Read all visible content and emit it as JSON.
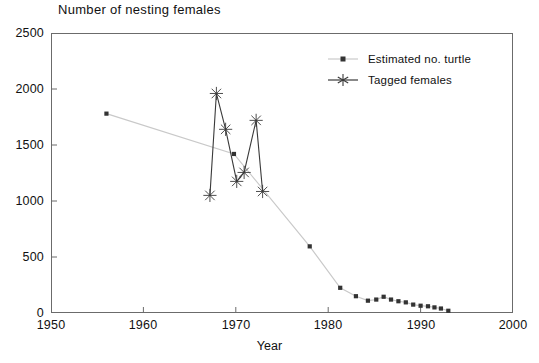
{
  "chart_data": {
    "type": "line",
    "title": "Number of nesting females",
    "xlabel": "Year",
    "ylabel": "",
    "xlim": [
      1950,
      2000
    ],
    "ylim": [
      0,
      2500
    ],
    "xticks": [
      1950,
      1960,
      1970,
      1980,
      1990,
      2000
    ],
    "yticks": [
      0,
      500,
      1000,
      1500,
      2000,
      2500
    ],
    "grid": false,
    "legend_position": "top-right",
    "series": [
      {
        "name": "Estimated no. turtle",
        "marker": "square",
        "color": "#c9c9c9",
        "marker_color": "#333333",
        "points": [
          {
            "x": 1956.0,
            "y": 1780
          },
          {
            "x": 1969.8,
            "y": 1420
          },
          {
            "x": 1978.0,
            "y": 595
          },
          {
            "x": 1981.3,
            "y": 225
          },
          {
            "x": 1983.0,
            "y": 150
          },
          {
            "x": 1984.3,
            "y": 110
          },
          {
            "x": 1985.2,
            "y": 120
          },
          {
            "x": 1986.0,
            "y": 145
          },
          {
            "x": 1986.8,
            "y": 120
          },
          {
            "x": 1987.6,
            "y": 105
          },
          {
            "x": 1988.4,
            "y": 95
          },
          {
            "x": 1989.2,
            "y": 75
          },
          {
            "x": 1990.0,
            "y": 65
          },
          {
            "x": 1990.8,
            "y": 60
          },
          {
            "x": 1991.5,
            "y": 50
          },
          {
            "x": 1992.2,
            "y": 40
          },
          {
            "x": 1993.0,
            "y": 20
          }
        ]
      },
      {
        "name": "Tagged females",
        "marker": "star",
        "color": "#3a3a3a",
        "marker_color": "#3a3a3a",
        "points": [
          {
            "x": 1967.2,
            "y": 1050
          },
          {
            "x": 1967.9,
            "y": 1960
          },
          {
            "x": 1968.9,
            "y": 1640
          },
          {
            "x": 1970.1,
            "y": 1175
          },
          {
            "x": 1970.9,
            "y": 1255
          },
          {
            "x": 1972.2,
            "y": 1720
          },
          {
            "x": 1972.9,
            "y": 1085
          }
        ]
      }
    ]
  },
  "legend": {
    "items": [
      {
        "label": "Estimated no. turtle"
      },
      {
        "label": "Tagged females"
      }
    ]
  },
  "axes": {
    "y_tick_labels": [
      "2500",
      "2000",
      "1500",
      "1000",
      "500",
      "0"
    ],
    "x_tick_labels": [
      "1950",
      "1960",
      "1970",
      "1980",
      "1990",
      "2000"
    ]
  }
}
